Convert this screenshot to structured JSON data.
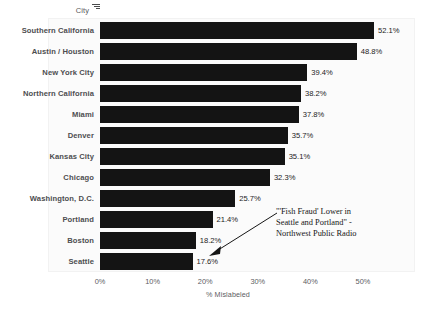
{
  "chart_data": {
    "type": "bar",
    "orientation": "horizontal",
    "title": "",
    "xlabel": "% Mislabeled",
    "ylabel": "City",
    "xlim": [
      0,
      55
    ],
    "xticks": [
      "0%",
      "10%",
      "20%",
      "30%",
      "40%",
      "50%"
    ],
    "xtick_values": [
      0,
      10,
      20,
      30,
      40,
      50
    ],
    "grid": false,
    "legend": "none",
    "categories": [
      "Southern California",
      "Austin / Houston",
      "New York City",
      "Northern California",
      "Miami",
      "Denver",
      "Kansas City",
      "Chicago",
      "Washington, D.C.",
      "Portland",
      "Boston",
      "Seattle"
    ],
    "values": [
      52.1,
      48.8,
      39.4,
      38.2,
      37.8,
      35.7,
      35.1,
      32.3,
      25.7,
      21.4,
      18.2,
      17.6
    ],
    "value_labels": [
      "52.1%",
      "48.8%",
      "39.4%",
      "38.2%",
      "37.8%",
      "35.7%",
      "35.1%",
      "32.3%",
      "25.7%",
      "21.4%",
      "18.2%",
      "17.6%"
    ],
    "bar_color": "#141414",
    "plot_background": "#fbfbfb",
    "annotations": [
      {
        "name": "fish-fraud-annotation",
        "lines": [
          "\"'Fish Fraud' Lower in",
          "Seattle and Portland\" -",
          "Northwest Public Radio"
        ]
      }
    ]
  },
  "axis_title": {
    "category_label": "City",
    "sort_icon": "sort-descending-icon"
  }
}
